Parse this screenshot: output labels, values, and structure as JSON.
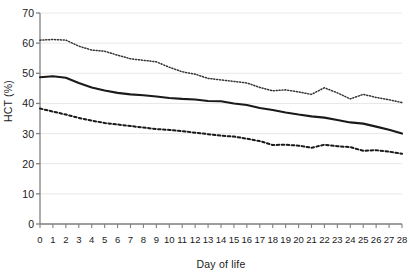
{
  "chart_data": {
    "type": "line",
    "title": "",
    "xlabel": "Day of life",
    "ylabel": "HCT (%)",
    "xlim": [
      0,
      28
    ],
    "ylim": [
      0,
      70
    ],
    "xticks": [
      0,
      1,
      2,
      3,
      4,
      5,
      6,
      7,
      8,
      9,
      10,
      11,
      12,
      13,
      14,
      15,
      16,
      17,
      18,
      19,
      20,
      21,
      22,
      23,
      24,
      25,
      26,
      27,
      28
    ],
    "yticks": [
      0,
      10,
      20,
      30,
      40,
      50,
      60,
      70
    ],
    "grid": "horizontal",
    "legend_position": "none",
    "x": [
      0,
      1,
      2,
      3,
      4,
      5,
      6,
      7,
      8,
      9,
      10,
      11,
      12,
      13,
      14,
      15,
      16,
      17,
      18,
      19,
      20,
      21,
      22,
      23,
      24,
      25,
      26,
      27,
      28
    ],
    "series": [
      {
        "name": "upper-percentile",
        "style": "dotted",
        "color": "#333333",
        "values": [
          61.0,
          61.2,
          61.0,
          59.0,
          57.7,
          57.3,
          56.0,
          54.8,
          54.3,
          53.8,
          52.0,
          50.5,
          49.7,
          48.3,
          47.8,
          47.3,
          46.8,
          45.3,
          44.2,
          44.5,
          43.8,
          43.0,
          45.2,
          43.5,
          41.5,
          43.0,
          42.0,
          41.2,
          40.3
        ]
      },
      {
        "name": "median",
        "style": "solid",
        "color": "#1a1a1a",
        "values": [
          48.7,
          49.0,
          48.5,
          46.8,
          45.3,
          44.3,
          43.5,
          43.0,
          42.7,
          42.3,
          41.8,
          41.5,
          41.3,
          40.8,
          40.7,
          40.0,
          39.5,
          38.5,
          37.8,
          37.0,
          36.3,
          35.7,
          35.3,
          34.5,
          33.7,
          33.3,
          32.3,
          31.3,
          30.0
        ]
      },
      {
        "name": "lower-percentile",
        "style": "dashed",
        "color": "#1a1a1a",
        "values": [
          38.3,
          37.3,
          36.3,
          35.2,
          34.3,
          33.5,
          33.0,
          32.5,
          32.0,
          31.5,
          31.2,
          30.8,
          30.3,
          29.8,
          29.3,
          29.0,
          28.3,
          27.5,
          26.2,
          26.3,
          26.0,
          25.3,
          26.3,
          25.8,
          25.5,
          24.3,
          24.5,
          24.0,
          23.3
        ]
      }
    ]
  },
  "axis": {
    "y_tick_labels": [
      "70",
      "60",
      "50",
      "40",
      "30",
      "20",
      "10",
      "0"
    ],
    "x_tick_labels": [
      "0",
      "1",
      "2",
      "3",
      "4",
      "5",
      "6",
      "7",
      "8",
      "9",
      "10",
      "11",
      "12",
      "13",
      "14",
      "15",
      "16",
      "17",
      "18",
      "19",
      "20",
      "21",
      "22",
      "23",
      "24",
      "25",
      "26",
      "27",
      "28"
    ]
  },
  "colors": {
    "grid": "#e8e8e8",
    "axis": "#808080",
    "ink": "#1a1a1a"
  }
}
